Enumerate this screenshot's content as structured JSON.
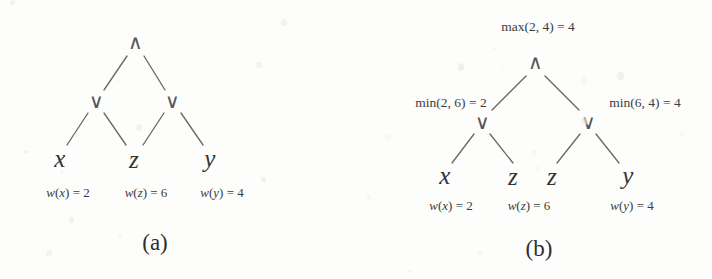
{
  "figure": {
    "background_color": "#fdfdfc",
    "ink_color": "#3b3b3b",
    "panels": [
      {
        "id": "a",
        "caption": "(a)",
        "gates": [
          {
            "name": "root-and-gate",
            "symbol": "∧",
            "kind": "and",
            "x": 135,
            "y": 42
          },
          {
            "name": "left-or-gate",
            "symbol": "∨",
            "kind": "or",
            "x": 96,
            "y": 101
          },
          {
            "name": "right-or-gate",
            "symbol": "∨",
            "kind": "or",
            "x": 172,
            "y": 101
          }
        ],
        "leaves": [
          {
            "name": "leaf-x",
            "label": "x",
            "x": 60,
            "y": 158
          },
          {
            "name": "leaf-z",
            "label": "z",
            "x": 134,
            "y": 159
          },
          {
            "name": "leaf-y",
            "label": "y",
            "x": 210,
            "y": 158
          }
        ],
        "weights": [
          {
            "name": "weight-x",
            "text": "w(x) = 2",
            "var": "x",
            "value": 2,
            "x": 68,
            "y": 192
          },
          {
            "name": "weight-z",
            "text": "w(z) = 6",
            "var": "z",
            "value": 6,
            "x": 146,
            "y": 192
          },
          {
            "name": "weight-y",
            "text": "w(y) = 4",
            "var": "y",
            "value": 4,
            "x": 222,
            "y": 192
          }
        ],
        "annotations": [],
        "edges": [
          {
            "name": "edge-root-to-left-or",
            "x1": 127,
            "y1": 56,
            "x2": 104,
            "y2": 90
          },
          {
            "name": "edge-root-to-right-or",
            "x1": 144,
            "y1": 56,
            "x2": 165,
            "y2": 90
          },
          {
            "name": "edge-left-or-to-x",
            "x1": 88,
            "y1": 113,
            "x2": 67,
            "y2": 145
          },
          {
            "name": "edge-left-or-to-z",
            "x1": 104,
            "y1": 113,
            "x2": 126,
            "y2": 145
          },
          {
            "name": "edge-right-or-to-z",
            "x1": 164,
            "y1": 113,
            "x2": 143,
            "y2": 145
          },
          {
            "name": "edge-right-or-to-y",
            "x1": 181,
            "y1": 113,
            "x2": 203,
            "y2": 145
          }
        ],
        "caption_x": 155,
        "caption_y": 242
      },
      {
        "id": "b",
        "caption": "(b)",
        "gates": [
          {
            "name": "root-and-gate",
            "symbol": "∧",
            "kind": "and",
            "x": 179,
            "y": 62
          },
          {
            "name": "left-or-gate",
            "symbol": "∨",
            "kind": "or",
            "x": 126,
            "y": 122
          },
          {
            "name": "right-or-gate",
            "symbol": "∨",
            "kind": "or",
            "x": 232,
            "y": 122
          }
        ],
        "leaves": [
          {
            "name": "leaf-x",
            "label": "x",
            "x": 89,
            "y": 175
          },
          {
            "name": "leaf-z1",
            "label": "z",
            "x": 157,
            "y": 176
          },
          {
            "name": "leaf-z2",
            "label": "z",
            "x": 196,
            "y": 176
          },
          {
            "name": "leaf-y",
            "label": "y",
            "x": 272,
            "y": 175
          }
        ],
        "weights": [
          {
            "name": "weight-x",
            "text": "w(x) = 2",
            "var": "x",
            "value": 2,
            "x": 95,
            "y": 205
          },
          {
            "name": "weight-z",
            "text": "w(z) = 6",
            "var": "z",
            "value": 6,
            "x": 173,
            "y": 205
          },
          {
            "name": "weight-y",
            "text": "w(y) = 4",
            "var": "y",
            "value": 4,
            "x": 276,
            "y": 205
          }
        ],
        "annotations": [
          {
            "name": "root-max-annotation",
            "text": "max(2, 4) = 4",
            "x": 182,
            "y": 27,
            "anchor": "center"
          },
          {
            "name": "left-or-min-annotation",
            "text": "min(2, 6) = 2",
            "x": 95,
            "y": 103,
            "anchor": "center"
          },
          {
            "name": "right-or-min-annotation",
            "text": "min(6, 4) = 4",
            "x": 289,
            "y": 103,
            "anchor": "center"
          }
        ],
        "edges": [
          {
            "name": "edge-root-to-left-or",
            "x1": 170,
            "y1": 76,
            "x2": 136,
            "y2": 110
          },
          {
            "name": "edge-root-to-right-or",
            "x1": 189,
            "y1": 76,
            "x2": 223,
            "y2": 110
          },
          {
            "name": "edge-left-or-to-x",
            "x1": 118,
            "y1": 134,
            "x2": 96,
            "y2": 163
          },
          {
            "name": "edge-left-or-to-z",
            "x1": 134,
            "y1": 134,
            "x2": 157,
            "y2": 163
          },
          {
            "name": "edge-right-or-to-z",
            "x1": 224,
            "y1": 134,
            "x2": 201,
            "y2": 163
          },
          {
            "name": "edge-right-or-to-y",
            "x1": 240,
            "y1": 134,
            "x2": 263,
            "y2": 163
          }
        ],
        "caption_x": 183,
        "caption_y": 248
      }
    ]
  }
}
